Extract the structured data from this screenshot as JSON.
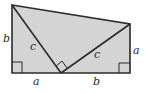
{
  "diagram": {
    "labels": {
      "left_side": "b",
      "right_side": "a",
      "bottom_left": "a",
      "bottom_right": "b",
      "hyp_left": "c",
      "hyp_right": "c"
    },
    "colors": {
      "fill": "#d4d4d4",
      "stroke": "#2b2b2b"
    }
  }
}
